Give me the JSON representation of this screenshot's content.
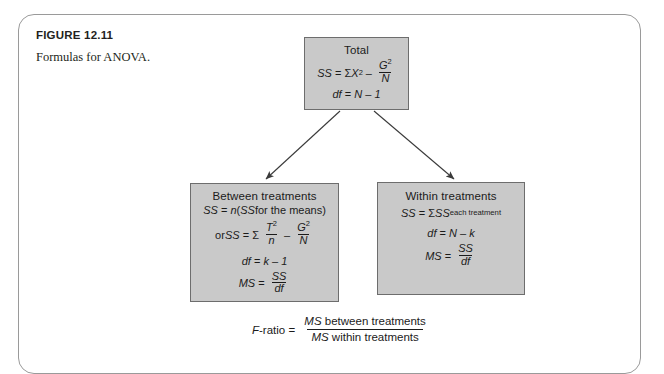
{
  "figure": {
    "number": "FIGURE 12.11",
    "caption": "Formulas for ANOVA."
  },
  "colors": {
    "box_fill": "#c9c9c9",
    "box_border": "#6d6d6d",
    "frame_border": "#9a9a9a",
    "text": "#1b1b1b"
  },
  "boxes": {
    "total": {
      "title": "Total",
      "ss_label": "SS",
      "ss_eq": "=",
      "ss_sigma": "Σ",
      "ss_x": "X",
      "ss_x_exp": "2",
      "ss_minus": "–",
      "ss_num": "G",
      "ss_num_exp": "2",
      "ss_den": "N",
      "df_label": "df",
      "df_eq": "=",
      "df_expr": "N – 1"
    },
    "between": {
      "title": "Between treatments",
      "ss_label": "SS",
      "ss_eq": "=",
      "ss_n": "n",
      "ss_paren_open": "(",
      "ss_inner_ss": "SS",
      "ss_inner_text": " for the means",
      "ss_paren_close": ")",
      "or_word": "or ",
      "or_ss_label": "SS",
      "or_eq": "=",
      "or_sigma": "Σ",
      "or_frac1_num": "T",
      "or_frac1_num_exp": "2",
      "or_frac1_den": "n",
      "or_minus": "–",
      "or_frac2_num": "G",
      "or_frac2_num_exp": "2",
      "or_frac2_den": "N",
      "df_label": "df",
      "df_eq": "=",
      "df_expr": "k – 1",
      "ms_label": "MS",
      "ms_eq": "=",
      "ms_num": "SS",
      "ms_den": "df"
    },
    "within": {
      "title": "Within treatments",
      "ss_label": "SS",
      "ss_eq": "=",
      "ss_sigma": "Σ",
      "ss_ss": "SS",
      "ss_sub": "each treatment",
      "df_label": "df",
      "df_eq": "=",
      "df_expr": "N – k",
      "ms_label": "MS",
      "ms_eq": "=",
      "ms_num": "SS",
      "ms_den": "df"
    }
  },
  "f_ratio": {
    "label": "F",
    "label_rest": "-ratio",
    "eq": "=",
    "num_italic": "MS",
    "num_text": " between treatments",
    "den_italic": "MS",
    "den_text": " within treatments"
  },
  "arrows": [
    {
      "name": "arrow-total-to-between",
      "from": [
        340,
        111
      ],
      "to": [
        265,
        180
      ]
    },
    {
      "name": "arrow-total-to-within",
      "from": [
        374,
        111
      ],
      "to": [
        455,
        180
      ]
    }
  ]
}
